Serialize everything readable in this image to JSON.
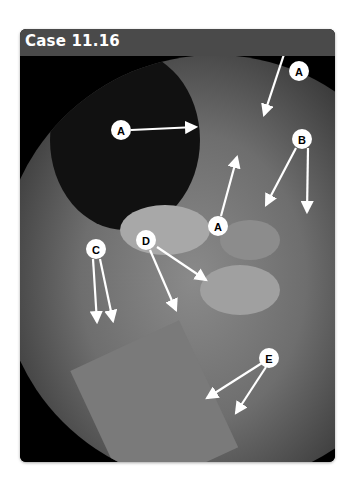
{
  "case": {
    "title": "Case 11.16"
  },
  "labels": [
    {
      "letter": "A",
      "x": 299,
      "y": 15
    },
    {
      "letter": "A",
      "x": 121,
      "y": 130
    },
    {
      "letter": "A",
      "x": 218,
      "y": 226
    },
    {
      "letter": "B",
      "x": 302,
      "y": 139
    },
    {
      "letter": "C",
      "x": 96,
      "y": 249
    },
    {
      "letter": "D",
      "x": 146,
      "y": 240
    },
    {
      "letter": "E",
      "x": 269,
      "y": 358
    }
  ],
  "colors": {
    "header": "#4a4a4a",
    "panel": "#000000",
    "label_fill": "#ffffff"
  }
}
